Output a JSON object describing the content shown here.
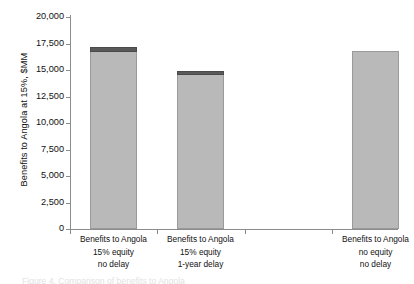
{
  "chart_data": {
    "type": "bar",
    "title": "",
    "subtitle": "",
    "xlabel": "",
    "ylabel": "Benefits to Angola at 15%, $MM",
    "ylim": [
      0,
      20000
    ],
    "ytick_values": [
      20000,
      17500,
      15000,
      12500,
      10000,
      7500,
      5000,
      2500,
      0
    ],
    "ytick_labels": [
      "20,000",
      "17,500",
      "15,000",
      "12,500",
      "10,000",
      "7,500",
      "5,000",
      "2,500",
      "0"
    ],
    "grid": false,
    "legend": "none",
    "categories": [
      "Benefits to Angola 15% equity no delay",
      "Benefits to Angola 15% equity 1-year delay",
      "Benefits to Angola no equity no delay"
    ],
    "category_label_lines": [
      [
        "Benefits to Angola",
        "15% equity",
        "no delay"
      ],
      [
        "Benefits to Angola",
        "15% equity",
        "1-year delay"
      ],
      [
        "Benefits to Angola",
        "no equity",
        "no delay"
      ]
    ],
    "stacked": true,
    "series": [
      {
        "name": "main",
        "color": "#b9b9b9",
        "values": [
          16700,
          14500,
          16800
        ]
      },
      {
        "name": "cap",
        "color": "#595959",
        "values": [
          500,
          400,
          0
        ]
      }
    ],
    "totals": [
      17200,
      14900,
      16800
    ]
  },
  "axes": {
    "y_axis_title": "Benefits to Angola at 15%, $MM"
  },
  "caption": {
    "cutoff_text": "Figure 4. Comparison of benefits to Angola"
  },
  "colors": {
    "bar_fill": "#b9b9b9",
    "bar_border": "#9a9a9a",
    "bar_cap_fill": "#595959",
    "axis": "#8c8c8c",
    "text": "#111111",
    "background": "#ffffff"
  }
}
